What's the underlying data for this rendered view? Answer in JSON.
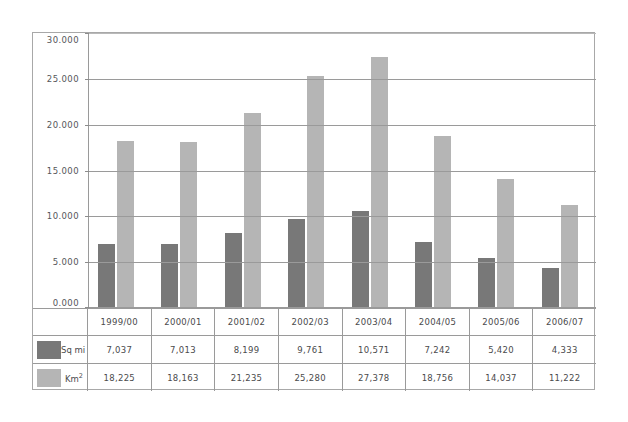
{
  "chart_data": {
    "type": "bar",
    "title": "",
    "xlabel": "",
    "ylabel": "",
    "ylim": [
      0,
      30000
    ],
    "grid": true,
    "legend_position": "bottom-table",
    "categories": [
      "1999/00",
      "2000/01",
      "2001/02",
      "2002/03",
      "2003/04",
      "2004/05",
      "2005/06",
      "2006/07"
    ],
    "ytick_labels": [
      "30.000",
      "25.000",
      "20.000",
      "15.000",
      "10.000",
      "5.000",
      "0.000"
    ],
    "ytick_values": [
      30000,
      25000,
      20000,
      15000,
      10000,
      5000,
      0
    ],
    "series": [
      {
        "name": "Sq mi",
        "color": "#787878",
        "values": [
          7037,
          7013,
          8199,
          9761,
          10571,
          7242,
          5420,
          4333
        ],
        "labels": [
          "7,037",
          "7,013",
          "8,199",
          "9,761",
          "10,571",
          "7,242",
          "5,420",
          "4,333"
        ]
      },
      {
        "name": "Km2",
        "name_display": "Km",
        "name_sup": "2",
        "color": "#b5b5b5",
        "values": [
          18225,
          18163,
          21235,
          25280,
          27378,
          18756,
          14037,
          11222
        ],
        "labels": [
          "18,225",
          "18,163",
          "21,235",
          "25,280",
          "27,378",
          "18,756",
          "14,037",
          "11,222"
        ]
      }
    ]
  }
}
